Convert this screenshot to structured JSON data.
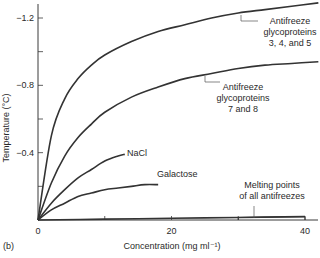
{
  "panel_label": "(b)",
  "chart_data": {
    "type": "line",
    "title": "",
    "xlabel": "Concentration (mg ml⁻¹)",
    "ylabel": "Temperature (°C)",
    "xlim": [
      0,
      42
    ],
    "ylim": [
      0,
      -1.3
    ],
    "x_ticks": [
      0,
      20,
      40
    ],
    "x_tick_labels": [
      "0",
      "20",
      "40"
    ],
    "x_minor_ticks": [
      10,
      30
    ],
    "y_ticks": [
      -0.4,
      -0.8,
      -1.2
    ],
    "y_tick_labels": [
      "-0.4",
      "-0.8",
      "-1.2"
    ],
    "y_minor_ticks": [
      -0.2,
      -0.6,
      -1.0
    ],
    "grid": false,
    "legend": "inline annotations",
    "series": [
      {
        "name": "Antifreeze glycoproteins 3, 4, and 5",
        "label_lines": [
          "Antifreeze",
          "glycoproteins",
          "3, 4, and 5"
        ],
        "x": [
          0,
          2,
          4,
          6,
          8,
          10,
          14,
          18,
          22,
          26,
          30,
          34,
          38,
          42
        ],
        "y": [
          0,
          -0.5,
          -0.72,
          -0.84,
          -0.92,
          -0.98,
          -1.06,
          -1.12,
          -1.16,
          -1.2,
          -1.23,
          -1.25,
          -1.27,
          -1.29
        ]
      },
      {
        "name": "Antifreeze glycoproteins 7 and 8",
        "label_lines": [
          "Antifreeze",
          "glycoproteins",
          "7 and 8"
        ],
        "x": [
          0,
          2,
          4,
          6,
          8,
          10,
          14,
          18,
          22,
          26,
          30,
          34,
          38,
          42
        ],
        "y": [
          0,
          -0.22,
          -0.38,
          -0.49,
          -0.57,
          -0.64,
          -0.73,
          -0.79,
          -0.84,
          -0.87,
          -0.9,
          -0.92,
          -0.93,
          -0.94
        ]
      },
      {
        "name": "NaCl",
        "label_lines": [
          "NaCl"
        ],
        "x": [
          0,
          2,
          4,
          6,
          8,
          10,
          12,
          13
        ],
        "y": [
          0,
          -0.1,
          -0.18,
          -0.25,
          -0.3,
          -0.35,
          -0.38,
          -0.39
        ]
      },
      {
        "name": "Galactose",
        "label_lines": [
          "Galactose"
        ],
        "x": [
          0,
          2,
          4,
          6,
          8,
          10,
          12,
          14,
          16,
          18
        ],
        "y": [
          0,
          -0.06,
          -0.1,
          -0.14,
          -0.16,
          -0.18,
          -0.19,
          -0.2,
          -0.21,
          -0.21
        ]
      },
      {
        "name": "Melting points of all antifreezes",
        "label_lines": [
          "Melting points",
          "of all antifreezes"
        ],
        "x": [
          0,
          10,
          20,
          30,
          40
        ],
        "y": [
          0,
          -0.005,
          -0.01,
          -0.015,
          -0.02
        ]
      }
    ]
  }
}
